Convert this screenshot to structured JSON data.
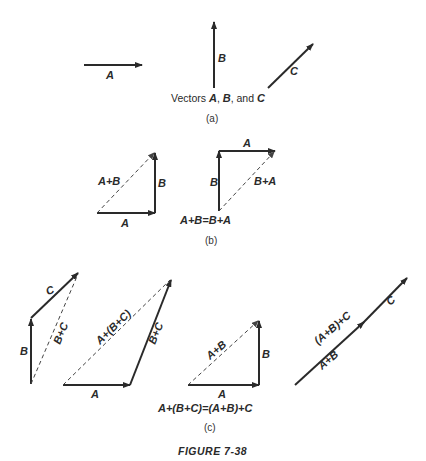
{
  "figure": {
    "title": "FIGURE 7-38",
    "panels": [
      {
        "id": "a",
        "label": "(a)",
        "caption_prefix": "Vectors ",
        "caption_vars": [
          "A",
          "B",
          "C"
        ],
        "caption_sep1": ", ",
        "caption_sep2": ", and ",
        "vectors": [
          {
            "name": "A",
            "label": "A"
          },
          {
            "name": "B",
            "label": "B"
          },
          {
            "name": "C",
            "label": "C"
          }
        ]
      },
      {
        "id": "b",
        "label": "(b)",
        "equation": "A+B=B+A",
        "left_triangle": {
          "a_label": "A",
          "b_label": "B",
          "sum_label": "A+B"
        },
        "right_triangle": {
          "a_label": "A",
          "b_label": "B",
          "sum_label": "B+A"
        }
      },
      {
        "id": "c",
        "label": "(c)",
        "equation": "A+(B+C)=(A+B)+C",
        "fig1": {
          "b_label": "B",
          "c_label": "C",
          "sum_label": "B+C"
        },
        "fig2": {
          "a_label": "A",
          "bc_label": "B+C",
          "sum_label": "A+(B+C)"
        },
        "fig3": {
          "a_label": "A",
          "b_label": "B",
          "sum_label": "A+B"
        },
        "fig4": {
          "ab_label": "A+B",
          "c_label": "C",
          "sum_label": "(A+B)+C"
        }
      }
    ]
  }
}
